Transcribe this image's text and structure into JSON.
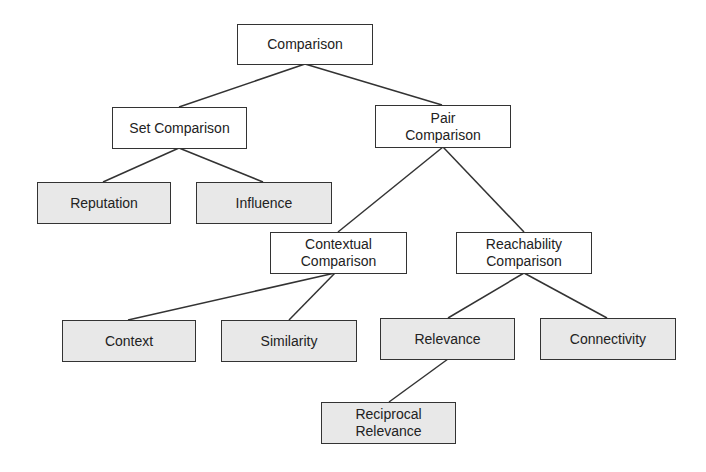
{
  "diagram": {
    "colors": {
      "border": "#333333",
      "internal_fill": "#ffffff",
      "leaf_fill": "#e8e8e8",
      "text": "#222222",
      "edge": "#333333"
    },
    "nodes": {
      "comparison": {
        "lines": [
          "Comparison"
        ],
        "type": "internal"
      },
      "set_comparison": {
        "lines": [
          "Set Comparison"
        ],
        "type": "internal"
      },
      "pair_comparison": {
        "lines": [
          "Pair",
          "Comparison"
        ],
        "type": "internal"
      },
      "reputation": {
        "lines": [
          "Reputation"
        ],
        "type": "leaf"
      },
      "influence": {
        "lines": [
          "Influence"
        ],
        "type": "leaf"
      },
      "contextual_comparison": {
        "lines": [
          "Contextual",
          "Comparison"
        ],
        "type": "internal"
      },
      "reachability_comparison": {
        "lines": [
          "Reachability",
          "Comparison"
        ],
        "type": "internal"
      },
      "context": {
        "lines": [
          "Context"
        ],
        "type": "leaf"
      },
      "similarity": {
        "lines": [
          "Similarity"
        ],
        "type": "leaf"
      },
      "relevance": {
        "lines": [
          "Relevance"
        ],
        "type": "leaf"
      },
      "connectivity": {
        "lines": [
          "Connectivity"
        ],
        "type": "leaf"
      },
      "reciprocal_relevance": {
        "lines": [
          "Reciprocal",
          "Relevance"
        ],
        "type": "leaf"
      }
    },
    "edges": [
      {
        "from": "comparison",
        "to": "set_comparison"
      },
      {
        "from": "comparison",
        "to": "pair_comparison"
      },
      {
        "from": "set_comparison",
        "to": "reputation"
      },
      {
        "from": "set_comparison",
        "to": "influence"
      },
      {
        "from": "pair_comparison",
        "to": "contextual_comparison"
      },
      {
        "from": "pair_comparison",
        "to": "reachability_comparison"
      },
      {
        "from": "contextual_comparison",
        "to": "context"
      },
      {
        "from": "contextual_comparison",
        "to": "similarity"
      },
      {
        "from": "reachability_comparison",
        "to": "relevance"
      },
      {
        "from": "reachability_comparison",
        "to": "connectivity"
      },
      {
        "from": "relevance",
        "to": "reciprocal_relevance"
      }
    ]
  }
}
